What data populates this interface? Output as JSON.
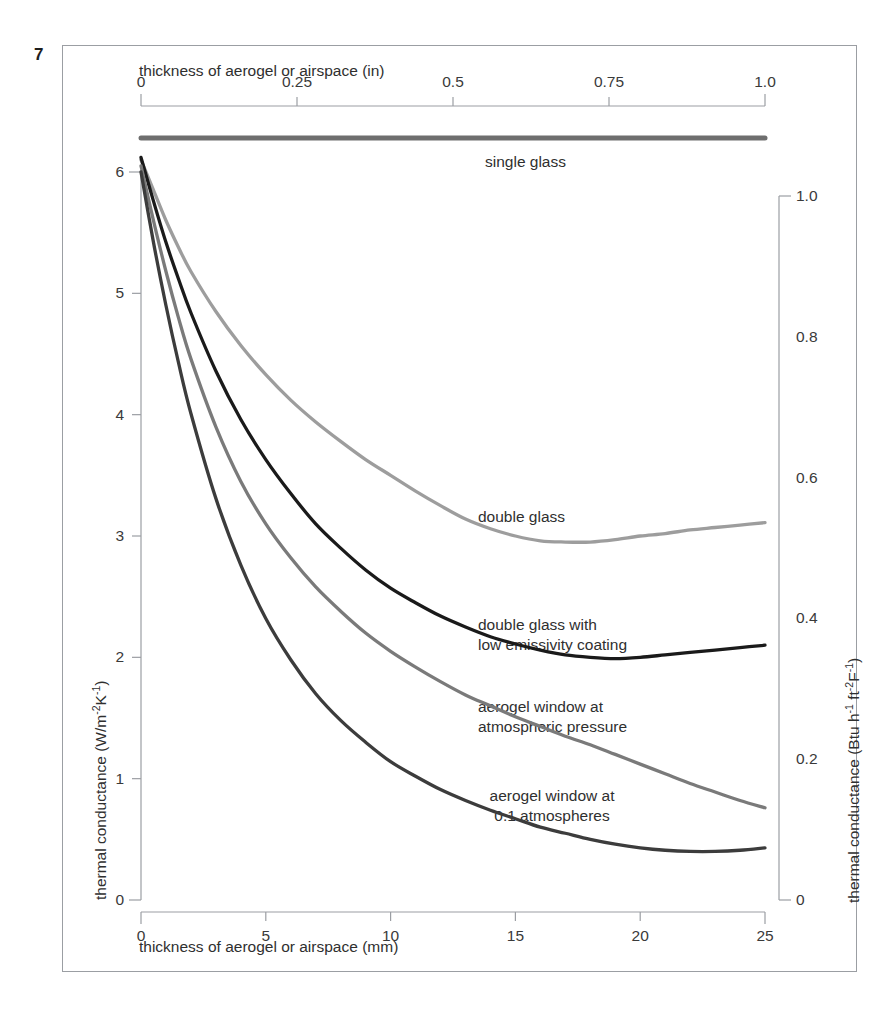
{
  "figure": {
    "number": "7"
  },
  "axes": {
    "top": {
      "title": "thickness of aerogel or airspace (in)",
      "ticks": [
        "0",
        "0.25",
        "0.5",
        "0.75",
        "1.0"
      ],
      "values": [
        0,
        0.25,
        0.5,
        0.75,
        1.0
      ],
      "range": [
        0,
        1.0
      ]
    },
    "bottom": {
      "title": "thickness of aerogel or airspace (mm)",
      "ticks": [
        "0",
        "5",
        "10",
        "15",
        "20",
        "25"
      ],
      "values": [
        0,
        5,
        10,
        15,
        20,
        25
      ],
      "range": [
        0,
        25
      ]
    },
    "left": {
      "title_parts": [
        "thermal conductance (W/m",
        "-2",
        "K",
        "-1",
        ")"
      ],
      "title": "thermal conductance (W/m-2K-1)",
      "ticks": [
        "0",
        "1",
        "2",
        "3",
        "4",
        "5",
        "6"
      ],
      "values": [
        0,
        1,
        2,
        3,
        4,
        5,
        6
      ],
      "range": [
        0,
        6
      ]
    },
    "right": {
      "title_parts": [
        "thermal conductance (Btu h",
        "-1",
        " ft",
        "-2",
        "F",
        "-1",
        ")"
      ],
      "title": "thermal conductance (Btu h-1 ft-2F-1)",
      "ticks": [
        "0",
        "0.2",
        "0.4",
        "0.6",
        "0.8",
        "1.0"
      ],
      "values": [
        0,
        0.2,
        0.4,
        0.6,
        0.8,
        1.0
      ],
      "range": [
        0,
        1.0
      ]
    }
  },
  "labels": {
    "single_glass": "single glass",
    "double_glass": "double glass",
    "double_glass_lowe": "double glass with\nlow emissivity coating",
    "aerogel_atm": "aerogel window at\natmospheric pressure",
    "aerogel_01": "aerogel window at\n0.1 atmospheres"
  },
  "colors": {
    "single_glass": "#6e6e6e",
    "double_glass": "#9d9d9d",
    "double_glass_lowe": "#1a1a1a",
    "aerogel_atm": "#7a7a7a",
    "aerogel_01": "#3c3c3c",
    "axis": "#9b9ea3",
    "frame": "#9b9ea3",
    "text": "#2f2f2f"
  },
  "chart_data": {
    "type": "line",
    "title": "",
    "xlabel": "thickness of aerogel or airspace (mm)",
    "ylabel": "thermal conductance (W/m-2K-1)",
    "xlim": [
      0,
      25
    ],
    "ylim": [
      0,
      6.4
    ],
    "grid": false,
    "legend": "inline labels next to each curve",
    "x": [
      0,
      0.5,
      1,
      1.5,
      2,
      3,
      4,
      5,
      6,
      7,
      8,
      9,
      10,
      11,
      12,
      13,
      14,
      15,
      16,
      17,
      18,
      19,
      20,
      21,
      22,
      23,
      24,
      25
    ],
    "series": [
      {
        "name": "single glass",
        "color": "#6e6e6e",
        "style": "horizontal constant line above 6",
        "values": [
          6.28,
          6.28,
          6.28,
          6.28,
          6.28,
          6.28,
          6.28,
          6.28,
          6.28,
          6.28,
          6.28,
          6.28,
          6.28,
          6.28,
          6.28,
          6.28,
          6.28,
          6.28,
          6.28,
          6.28,
          6.28,
          6.28,
          6.28,
          6.28,
          6.28,
          6.28,
          6.28,
          6.28
        ]
      },
      {
        "name": "double glass",
        "color": "#9d9d9d",
        "values": [
          6.1,
          5.85,
          5.6,
          5.38,
          5.18,
          4.85,
          4.57,
          4.33,
          4.12,
          3.94,
          3.78,
          3.63,
          3.5,
          3.37,
          3.25,
          3.14,
          3.06,
          3.0,
          2.96,
          2.95,
          2.95,
          2.97,
          3.0,
          3.02,
          3.05,
          3.07,
          3.09,
          3.11
        ]
      },
      {
        "name": "double glass with low emissivity coating",
        "color": "#1a1a1a",
        "values": [
          6.12,
          5.76,
          5.42,
          5.12,
          4.84,
          4.36,
          3.96,
          3.63,
          3.35,
          3.1,
          2.9,
          2.72,
          2.57,
          2.45,
          2.34,
          2.25,
          2.17,
          2.11,
          2.06,
          2.02,
          2.0,
          1.99,
          2.0,
          2.02,
          2.04,
          2.06,
          2.08,
          2.1
        ]
      },
      {
        "name": "aerogel window at atmospheric pressure",
        "color": "#7a7a7a",
        "values": [
          6.05,
          5.6,
          5.18,
          4.8,
          4.46,
          3.9,
          3.45,
          3.1,
          2.82,
          2.58,
          2.38,
          2.2,
          2.05,
          1.92,
          1.8,
          1.69,
          1.6,
          1.51,
          1.43,
          1.35,
          1.28,
          1.2,
          1.12,
          1.04,
          0.96,
          0.89,
          0.82,
          0.76
        ]
      },
      {
        "name": "aerogel window at 0.1 atmospheres",
        "color": "#3c3c3c",
        "values": [
          6.0,
          5.42,
          4.9,
          4.43,
          4.01,
          3.31,
          2.76,
          2.32,
          1.98,
          1.7,
          1.48,
          1.3,
          1.14,
          1.02,
          0.91,
          0.82,
          0.74,
          0.67,
          0.6,
          0.55,
          0.5,
          0.46,
          0.43,
          0.41,
          0.4,
          0.4,
          0.41,
          0.43
        ]
      }
    ]
  }
}
